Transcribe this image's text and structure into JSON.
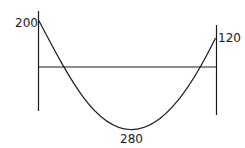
{
  "diagram": {
    "type": "bending-moment-diagram",
    "labels": {
      "left_value": "200",
      "right_value": "120",
      "min_value": "280"
    },
    "colors": {
      "line": "#1a1a1a",
      "background": "#ffffff"
    }
  }
}
